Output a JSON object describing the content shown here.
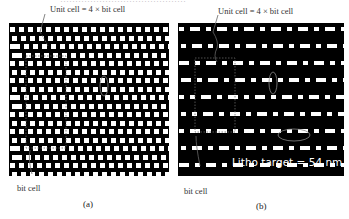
{
  "top_text": "……………………………………",
  "panels": [
    {
      "id": "a",
      "caption": "(a)",
      "unit_cell_label": "Unit cell = 4 × bit cell",
      "bit_cell_label": "bit cell"
    },
    {
      "id": "b",
      "caption": "(b)",
      "unit_cell_label": "Unit cell = 4 × bit cell",
      "bit_cell_label": "bit cell",
      "annotation": "Litho target = 54 nm"
    }
  ]
}
